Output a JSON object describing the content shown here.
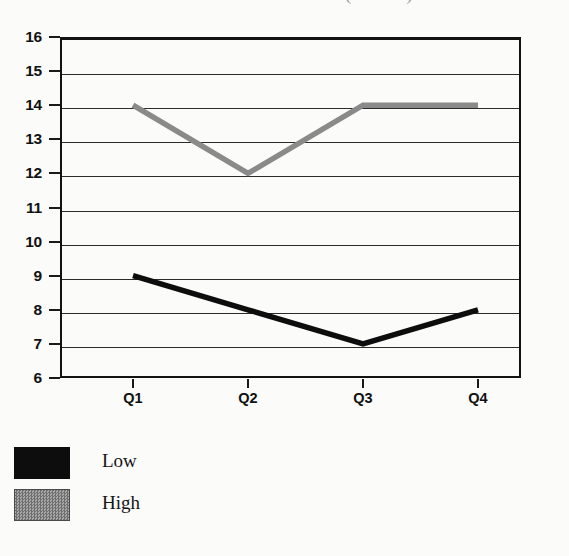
{
  "chart_data": {
    "type": "line",
    "title": "(dollars)",
    "title_note": "title is cropped at the top edge of the image; only the parenthesized word is partially visible",
    "xlabel": "",
    "ylabel": "",
    "categories": [
      "Q1",
      "Q2",
      "Q3",
      "Q4"
    ],
    "series": [
      {
        "name": "Low",
        "values": [
          9,
          8,
          7,
          8
        ],
        "color": "#0d0d0d"
      },
      {
        "name": "High",
        "values": [
          14,
          12,
          14,
          14
        ],
        "color": "#8a8a8a"
      }
    ],
    "ylim": [
      6,
      16
    ],
    "ytick_step": 1,
    "ytick_labels": [
      "16",
      "15",
      "14",
      "13",
      "12",
      "11",
      "10",
      "9",
      "8",
      "7",
      "6"
    ],
    "grid": true,
    "legend_position": "bottom-left",
    "legend_entries": [
      {
        "label": "Low",
        "color": "#0d0d0d"
      },
      {
        "label": "High",
        "color": "#8a8a8a"
      }
    ]
  },
  "legend": {
    "items": [
      {
        "label": "Low"
      },
      {
        "label": "High"
      }
    ]
  }
}
